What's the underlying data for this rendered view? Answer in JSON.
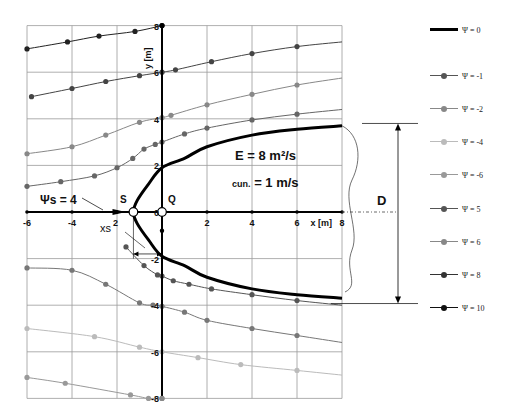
{
  "chart_data": {
    "type": "line",
    "title": "",
    "xlabel": "x [m]",
    "ylabel": "y [m]",
    "xlim": [
      -6,
      8
    ],
    "ylim": [
      -8,
      8
    ],
    "grid": true,
    "x_ticks": [
      "-6",
      "-4",
      "2",
      "0",
      "2",
      "4",
      "6",
      "8"
    ],
    "y_ticks": [
      "8",
      "6",
      "4",
      "2",
      "0",
      "-2",
      "-4",
      "-6",
      "-8"
    ],
    "legend_position": "right",
    "annotations": {
      "E": "E = 8 m²/s",
      "c": "cun. = 1 m/s",
      "psi_s": "Ψs = 4",
      "xs": "xs",
      "S": "S",
      "Q": "Q",
      "D": "D"
    },
    "series": [
      {
        "name": "Ψ = 0",
        "color": "#000000",
        "marker": false,
        "width": 3,
        "points": [
          [
            8,
            3.7
          ],
          [
            6,
            3.55
          ],
          [
            4,
            3.3
          ],
          [
            2,
            2.8
          ],
          [
            1,
            2.3
          ],
          [
            0,
            1.9
          ],
          [
            -0.6,
            1.2
          ],
          [
            -1.1,
            0.5
          ],
          [
            -1.27,
            0
          ],
          [
            -1.1,
            -0.5
          ],
          [
            -0.6,
            -1.2
          ],
          [
            0,
            -1.9
          ],
          [
            1,
            -2.3
          ],
          [
            2,
            -2.8
          ],
          [
            4,
            -3.3
          ],
          [
            6,
            -3.55
          ],
          [
            8,
            -3.7
          ]
        ]
      },
      {
        "name": "Ψ = -1",
        "color": "#555555",
        "marker": true,
        "points": [
          [
            -1.6,
            -1.5
          ],
          [
            -0.8,
            -2.3
          ],
          [
            -0.2,
            -2.7
          ],
          [
            0,
            -2.75
          ],
          [
            0.5,
            -2.95
          ],
          [
            1.2,
            -3.1
          ],
          [
            2.2,
            -3.3
          ],
          [
            4,
            -3.55
          ],
          [
            6,
            -3.8
          ],
          [
            8,
            -4.0
          ]
        ]
      },
      {
        "name": "Ψ = -2",
        "color": "#777777",
        "marker": true,
        "points": [
          [
            -6,
            -2.4
          ],
          [
            -4,
            -2.5
          ],
          [
            -2.5,
            -3.1
          ],
          [
            -1,
            -3.9
          ],
          [
            -0.4,
            -4.0
          ],
          [
            0,
            -4.05
          ],
          [
            1,
            -4.3
          ],
          [
            2,
            -4.65
          ],
          [
            4,
            -5.0
          ],
          [
            6,
            -5.3
          ],
          [
            8,
            -5.6
          ]
        ]
      },
      {
        "name": "Ψ = -4",
        "color": "#bbbbbb",
        "marker": true,
        "points": [
          [
            -6,
            -5.0
          ],
          [
            -3,
            -5.35
          ],
          [
            -1,
            -5.8
          ],
          [
            0,
            -6.0
          ],
          [
            1.6,
            -6.25
          ],
          [
            3.5,
            -6.55
          ],
          [
            6,
            -6.8
          ],
          [
            8,
            -7.0
          ]
        ]
      },
      {
        "name": "Ψ = -6",
        "color": "#999999",
        "marker": true,
        "points": [
          [
            -6,
            -7.1
          ],
          [
            -4.3,
            -7.35
          ],
          [
            -1.4,
            -7.85
          ],
          [
            -0.6,
            -8.0
          ],
          [
            0,
            -8.0
          ]
        ]
      },
      {
        "name": "Ψ = 5",
        "color": "#666666",
        "marker": true,
        "points": [
          [
            -6,
            1.1
          ],
          [
            -4.5,
            1.3
          ],
          [
            -3,
            1.55
          ],
          [
            -2,
            1.9
          ],
          [
            -1.3,
            2.3
          ],
          [
            -0.8,
            2.7
          ],
          [
            -0.3,
            2.9
          ],
          [
            0,
            3.0
          ],
          [
            1,
            3.35
          ],
          [
            2,
            3.6
          ],
          [
            4,
            3.95
          ],
          [
            6,
            4.2
          ],
          [
            8,
            4.4
          ]
        ]
      },
      {
        "name": "Ψ = 6",
        "color": "#888888",
        "marker": true,
        "points": [
          [
            -6,
            2.5
          ],
          [
            -4,
            2.8
          ],
          [
            -2.5,
            3.3
          ],
          [
            -1,
            3.85
          ],
          [
            0,
            4.05
          ],
          [
            0.4,
            4.15
          ],
          [
            2,
            4.6
          ],
          [
            4,
            5.05
          ],
          [
            6,
            5.45
          ],
          [
            8,
            5.75
          ]
        ]
      },
      {
        "name": "Ψ = 8",
        "color": "#444444",
        "marker": true,
        "points": [
          [
            -5.8,
            4.95
          ],
          [
            -4,
            5.3
          ],
          [
            -2.5,
            5.6
          ],
          [
            -1,
            5.85
          ],
          [
            0,
            6.0
          ],
          [
            0.6,
            6.1
          ],
          [
            2.2,
            6.45
          ],
          [
            4,
            6.8
          ],
          [
            6,
            7.1
          ],
          [
            8,
            7.3
          ]
        ]
      },
      {
        "name": "Ψ = 10",
        "color": "#222222",
        "marker": true,
        "points": [
          [
            -6,
            7.0
          ],
          [
            -4.2,
            7.3
          ],
          [
            -2.8,
            7.55
          ],
          [
            -1.2,
            7.75
          ],
          [
            0,
            8.0
          ]
        ]
      }
    ]
  },
  "axis_labels": {
    "x_axis": "x [m]",
    "y_axis": "y [m]"
  },
  "legend": [
    {
      "label": "Ψ = 0",
      "color": "#000000",
      "thick": true
    },
    {
      "label": "Ψ = -1",
      "color": "#555555"
    },
    {
      "label": "Ψ = -2",
      "color": "#888888"
    },
    {
      "label": "Ψ = -4",
      "color": "#bbbbbb"
    },
    {
      "label": "Ψ = -6",
      "color": "#999999"
    },
    {
      "label": "Ψ = 5",
      "color": "#555555"
    },
    {
      "label": "Ψ = 6",
      "color": "#888888"
    },
    {
      "label": "Ψ = 8",
      "color": "#333333"
    },
    {
      "label": "Ψ = 10",
      "color": "#111111"
    }
  ]
}
